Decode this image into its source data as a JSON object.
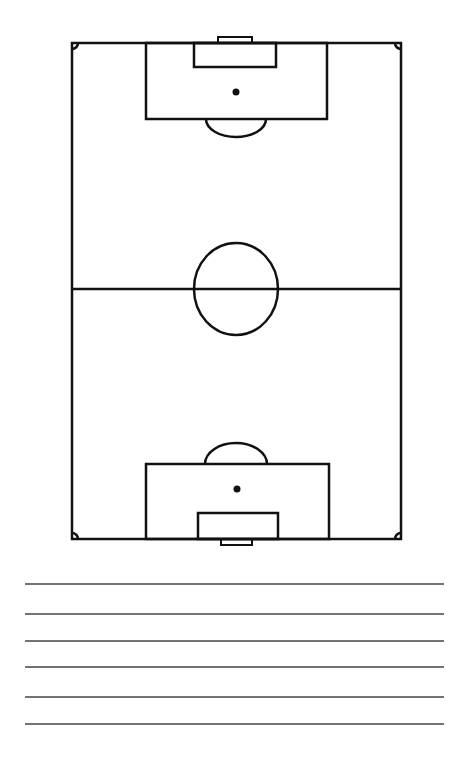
{
  "colors": {
    "line": "#111111",
    "background": "#ffffff",
    "note_line": "#444444"
  },
  "pitch": {
    "orientation": "vertical",
    "outline": {
      "x": 72,
      "y": 43,
      "w": 329,
      "h": 496
    },
    "halfway_y": 289,
    "center_circle": {
      "cx": 236,
      "cy": 289,
      "rx": 42,
      "ry": 46
    },
    "top": {
      "goal": {
        "x": 218,
        "y": 37,
        "w": 34,
        "h": 6
      },
      "goal_area": {
        "x": 194,
        "y": 43,
        "w": 82,
        "h": 24
      },
      "penalty_area": {
        "x": 146,
        "y": 43,
        "w": 181,
        "h": 76
      },
      "penalty_spot": {
        "cx": 236,
        "cy": 92
      },
      "arc": {
        "x1": 206,
        "x2": 266,
        "y": 119,
        "depth": 18
      }
    },
    "bottom": {
      "goal": {
        "x": 221,
        "y": 539,
        "w": 31,
        "h": 6
      },
      "goal_area": {
        "x": 198,
        "y": 513,
        "w": 80,
        "h": 26
      },
      "penalty_area": {
        "x": 146,
        "y": 464,
        "w": 183,
        "h": 75
      },
      "penalty_spot": {
        "cx": 237,
        "cy": 489
      },
      "arc": {
        "x1": 205,
        "x2": 267,
        "y": 464,
        "depth": 21
      }
    }
  },
  "note_lines": {
    "x1": 25,
    "x2": 444,
    "ys": [
      584,
      614,
      641,
      667,
      697,
      724
    ]
  }
}
